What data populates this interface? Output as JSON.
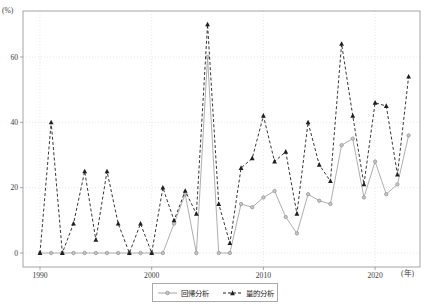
{
  "labels": {
    "y_unit": "(%)",
    "x_unit": "(年)"
  },
  "legend": {
    "items": [
      {
        "label": "回帰分析"
      },
      {
        "label": "量的分析"
      }
    ]
  },
  "chart_data": {
    "type": "line",
    "title": "",
    "xlabel": "(年)",
    "ylabel": "(%)",
    "x": [
      1990,
      1991,
      1992,
      1993,
      1994,
      1995,
      1996,
      1997,
      1998,
      1999,
      2000,
      2001,
      2002,
      2003,
      2004,
      2005,
      2006,
      2007,
      2008,
      2009,
      2010,
      2011,
      2012,
      2013,
      2014,
      2015,
      2016,
      2017,
      2018,
      2019,
      2020,
      2021,
      2022,
      2023
    ],
    "series": [
      {
        "name": "回帰分析",
        "style": "solid",
        "marker": "circle",
        "color": "#a5a5a5",
        "marker_fill": "#c6c6c6",
        "values": [
          0,
          0,
          0,
          0,
          0,
          0,
          0,
          0,
          0,
          0,
          0,
          0,
          9,
          18,
          0,
          60,
          0,
          0,
          15,
          14,
          17,
          19,
          11,
          6,
          18,
          16,
          15,
          33,
          35,
          17,
          28,
          18,
          21,
          36
        ]
      },
      {
        "name": "量的分析",
        "style": "dashed",
        "marker": "triangle",
        "color": "#1f1f1f",
        "marker_fill": "#1f1f1f",
        "values": [
          0,
          40,
          0,
          9,
          25,
          4,
          25,
          9,
          0,
          9,
          0,
          20,
          10,
          19,
          12,
          70,
          15,
          3,
          26,
          29,
          42,
          28,
          31,
          12,
          40,
          27,
          22,
          64,
          42,
          21,
          46,
          45,
          24,
          54
        ]
      }
    ],
    "yticks": [
      0,
      20,
      40,
      60
    ],
    "xticks": [
      1990,
      2000,
      2010,
      2020
    ],
    "ylim": [
      0,
      74
    ],
    "xlim": [
      1988.5,
      2024
    ],
    "grid": "dotted",
    "legend_position": "bottom-center",
    "grid_color": "#dedede",
    "frame_color": "#9c9c9c"
  }
}
